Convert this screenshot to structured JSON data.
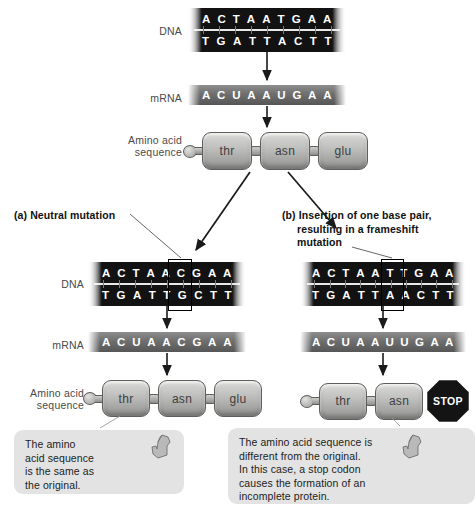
{
  "labels": {
    "dna": "DNA",
    "mrna": "mRNA",
    "amino_line1": "Amino acid",
    "amino_line2": "sequence"
  },
  "original": {
    "dna_top": [
      "A",
      "C",
      "T",
      "A",
      "A",
      "T",
      "G",
      "A",
      "A"
    ],
    "dna_bottom": [
      "T",
      "G",
      "A",
      "T",
      "T",
      "A",
      "C",
      "T",
      "T"
    ],
    "mrna": [
      "A",
      "C",
      "U",
      "A",
      "A",
      "U",
      "G",
      "A",
      "A"
    ],
    "amino_acids": [
      "thr",
      "asn",
      "glu"
    ]
  },
  "panel_a": {
    "heading": "(a) Neutral mutation",
    "dna_top": [
      "A",
      "C",
      "T",
      "A",
      "A",
      "C",
      "G",
      "A",
      "A"
    ],
    "dna_bottom": [
      "T",
      "G",
      "A",
      "T",
      "T",
      "G",
      "C",
      "T",
      "T"
    ],
    "mrna": [
      "A",
      "C",
      "U",
      "A",
      "A",
      "C",
      "G",
      "A",
      "A"
    ],
    "amino_acids": [
      "thr",
      "asn",
      "glu"
    ],
    "callout": [
      "The amino",
      "acid sequence",
      "is the same as",
      "the original."
    ]
  },
  "panel_b": {
    "heading_line1": "(b) Insertion of one base pair,",
    "heading_line2": "resulting in a frameshift",
    "heading_line3": "mutation",
    "dna_top": [
      "A",
      "C",
      "T",
      "A",
      "A",
      "T",
      "T",
      "G",
      "A",
      "A"
    ],
    "dna_bottom": [
      "T",
      "G",
      "A",
      "T",
      "T",
      "A",
      "A",
      "C",
      "T",
      "T"
    ],
    "mrna": [
      "A",
      "C",
      "U",
      "A",
      "A",
      "U",
      "U",
      "G",
      "A",
      "A"
    ],
    "amino_acids": [
      "thr",
      "asn"
    ],
    "stop_label": "STOP",
    "callout": [
      "The amino acid sequence is",
      "different from the original.",
      "In this case, a stop codon",
      "causes the formation of an",
      "incomplete protein."
    ]
  },
  "colors": {
    "dna_strand": "#121212",
    "mrna_strand": "#6f6f6f",
    "amino_acid_fill": "#c2c2c0",
    "callout_background": "#e3e3e3",
    "stop_sign": "#141414",
    "label_text": "#4a4a4a",
    "heading_text": "#111111"
  }
}
